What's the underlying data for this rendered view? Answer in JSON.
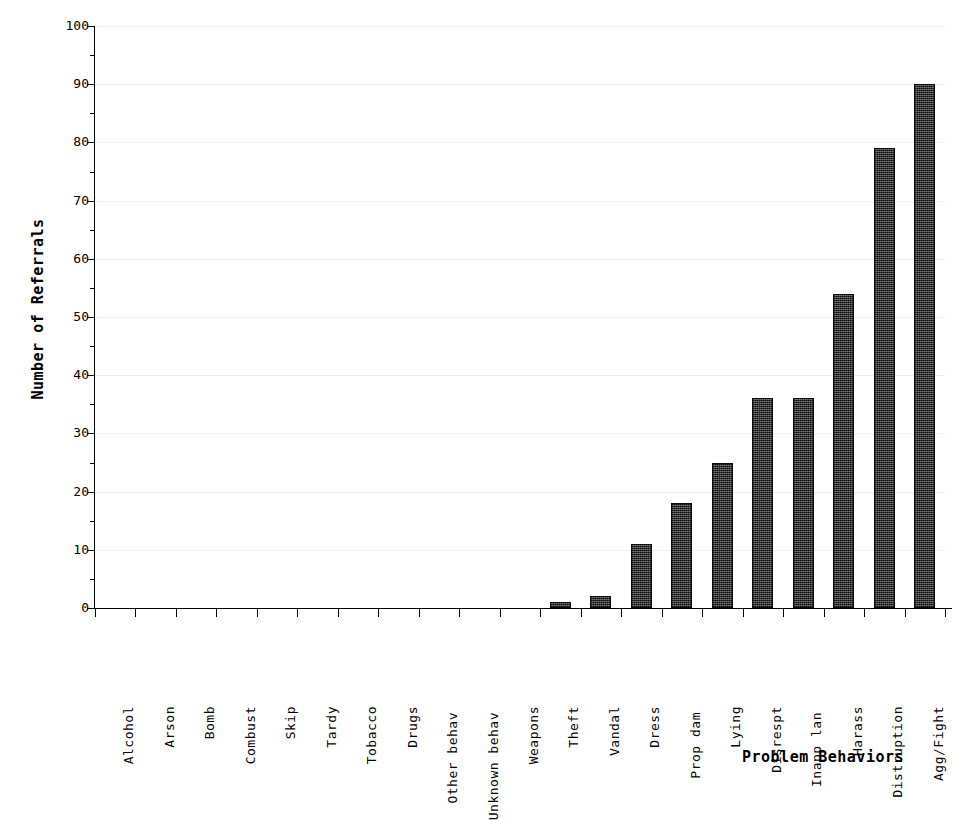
{
  "chart_data": {
    "type": "bar",
    "title": "",
    "xlabel": "Problem Behaviors",
    "ylabel": "Number of Referrals",
    "ylim": [
      0,
      100
    ],
    "ytick_labels": [
      "0",
      "10",
      "20",
      "30",
      "40",
      "50",
      "60",
      "70",
      "80",
      "90",
      "100"
    ],
    "ytick_values": [
      0,
      10,
      20,
      30,
      40,
      50,
      60,
      70,
      80,
      90,
      100
    ],
    "yminor_step": 5,
    "grid": "horizontal",
    "legend": "none",
    "categories": [
      "Alcohol",
      "Arson",
      "Bomb",
      "Combust",
      "Skip",
      "Tardy",
      "Tobacco",
      "Drugs",
      "Other behav",
      "Unknown behav",
      "Weapons",
      "Theft",
      "Vandal",
      "Dress",
      "Prop dam",
      "Lying",
      "Disrespt",
      "Inapp lan",
      "Harass",
      "Distruption",
      "Agg/Fight"
    ],
    "values": [
      0,
      0,
      0,
      0,
      0,
      0,
      0,
      0,
      0,
      0,
      0,
      1,
      2,
      11,
      18,
      25,
      36,
      36,
      54,
      79,
      90
    ],
    "bar_fill_color": "#4a4a4a",
    "bar_edge_color": "#0b0b0b",
    "grid_color": "#ededf2",
    "axis_color": "#000000"
  }
}
